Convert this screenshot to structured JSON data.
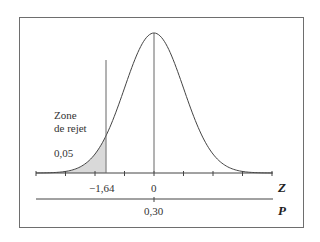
{
  "chart_data": {
    "type": "area",
    "title": "",
    "xlabel": "Z",
    "secondary_axis_label": "P",
    "xlim": [
      -4,
      4
    ],
    "x_ticks": [
      -4,
      -3,
      -2,
      -1,
      0,
      1,
      2,
      3,
      4
    ],
    "tick_labels": [
      {
        "value": -1.64,
        "label": "−1,64"
      },
      {
        "value": 0,
        "label": "0"
      }
    ],
    "secondary_tick_labels": [
      {
        "value": 0,
        "label": "0,30"
      }
    ],
    "critical_value": -1.64,
    "shaded_region": {
      "from": -4,
      "to": -1.64,
      "area": 0.05,
      "color": "#d9d9d9"
    },
    "annotations": [
      {
        "text": "Zone",
        "position": "upper-left of critical line"
      },
      {
        "text": "de rejet",
        "position": "upper-left of critical line"
      },
      {
        "text": "0,05",
        "position": "inside shaded tail"
      }
    ],
    "vertical_lines": [
      -1.64,
      0
    ],
    "grid": false,
    "legend": null
  },
  "labels": {
    "zone_line1": "Zone",
    "zone_line2": "de rejet",
    "alpha": "0,05",
    "crit": "−1,64",
    "zero": "0",
    "p_value": "0,30",
    "z_axis": "Z",
    "p_axis": "P"
  }
}
